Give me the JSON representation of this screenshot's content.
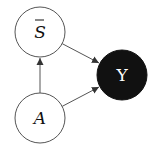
{
  "diagram": {
    "type": "causal-graph",
    "nodes": [
      {
        "id": "S_bar",
        "label": "S",
        "overbar": true,
        "italic": true,
        "fill": "#ffffff",
        "text_color": "#111111",
        "stroke": "#555555"
      },
      {
        "id": "A",
        "label": "A",
        "overbar": false,
        "italic": true,
        "fill": "#ffffff",
        "text_color": "#111111",
        "stroke": "#555555"
      },
      {
        "id": "Y",
        "label": "Y",
        "overbar": false,
        "italic": false,
        "fill": "#111111",
        "text_color": "#ffffff",
        "stroke": "#111111"
      }
    ],
    "edges": [
      {
        "from": "A",
        "to": "S_bar",
        "directed": true
      },
      {
        "from": "S_bar",
        "to": "Y",
        "directed": true
      },
      {
        "from": "A",
        "to": "Y",
        "directed": true
      }
    ],
    "edge_color": "#555555"
  }
}
